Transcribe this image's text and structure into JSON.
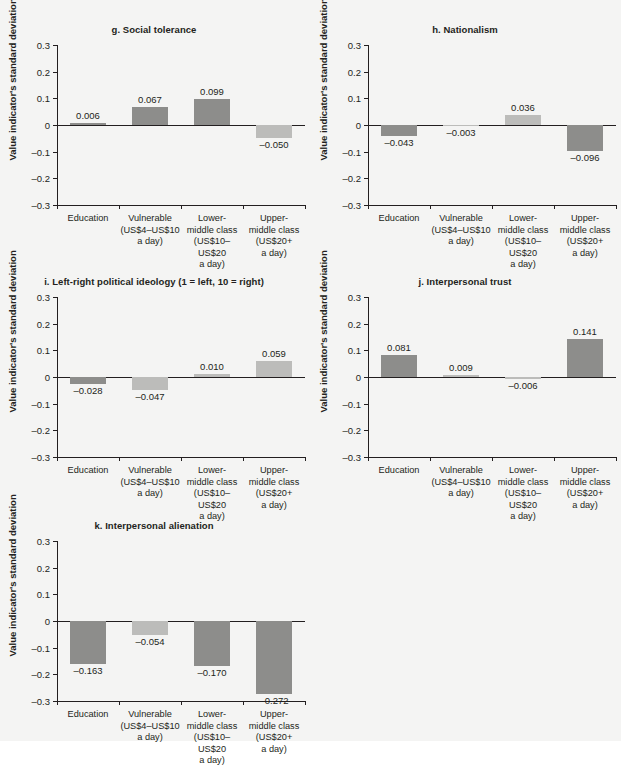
{
  "figure": {
    "background_color": "#f4f4f3",
    "bar_color_dark": "#8d8d8b",
    "bar_color_light": "#bcbcba",
    "axis_color": "#231f20",
    "y_axis_label": "Value indicator's standard deviation",
    "y_ticks": [
      "0.3",
      "0.2",
      "0.1",
      "0",
      "–0.1",
      "–0.2",
      "–0.3"
    ],
    "categories": [
      [
        "Education"
      ],
      [
        "Vulnerable",
        "(US$4–US$10",
        "a day)"
      ],
      [
        "Lower-",
        "middle class",
        "(US$10–US$20",
        "a day)"
      ],
      [
        "Upper-",
        "middle class",
        "(US$20+",
        "a day)"
      ]
    ],
    "caption": ""
  },
  "chart_data": [
    {
      "type": "bar",
      "panel": "g",
      "title": "g.  Social tolerance",
      "categories": [
        "Education",
        "Vulnerable (US$4–US$10 a day)",
        "Lower-middle class (US$10–US$20 a day)",
        "Upper-middle class (US$20+ a day)"
      ],
      "values": [
        0.006,
        0.067,
        0.099,
        -0.05
      ],
      "labels": [
        "0.006",
        "0.067",
        "0.099",
        "–0.050"
      ],
      "shades": [
        "dark",
        "dark",
        "dark",
        "light"
      ],
      "xlabel": "",
      "ylabel": "Value indicator's standard deviation",
      "ylim": [
        -0.3,
        0.3
      ],
      "grid": false,
      "legend": "none"
    },
    {
      "type": "bar",
      "panel": "h",
      "title": "h.  Nationalism",
      "categories": [
        "Education",
        "Vulnerable (US$4–US$10 a day)",
        "Lower-middle class (US$10–US$20 a day)",
        "Upper-middle class (US$20+ a day)"
      ],
      "values": [
        -0.043,
        -0.003,
        0.036,
        -0.096
      ],
      "labels": [
        "–0.043",
        "–0.003",
        "0.036",
        "–0.096"
      ],
      "shades": [
        "dark",
        "light",
        "light",
        "dark"
      ],
      "xlabel": "",
      "ylabel": "Value indicator's standard deviation",
      "ylim": [
        -0.3,
        0.3
      ],
      "grid": false,
      "legend": "none"
    },
    {
      "type": "bar",
      "panel": "i",
      "title": "i.  Left-right political ideology (1 = left, 10 = right)",
      "categories": [
        "Education",
        "Vulnerable (US$4–US$10 a day)",
        "Lower-middle class (US$10–US$20 a day)",
        "Upper-middle class (US$20+ a day)"
      ],
      "values": [
        -0.028,
        -0.047,
        0.01,
        0.059
      ],
      "labels": [
        "–0.028",
        "–0.047",
        "0.010",
        "0.059"
      ],
      "shades": [
        "dark",
        "light",
        "light",
        "light"
      ],
      "xlabel": "",
      "ylabel": "Value indicator's standard deviation",
      "ylim": [
        -0.3,
        0.3
      ],
      "grid": false,
      "legend": "none"
    },
    {
      "type": "bar",
      "panel": "j",
      "title": "j.  Interpersonal trust",
      "categories": [
        "Education",
        "Vulnerable (US$4–US$10 a day)",
        "Lower-middle class (US$10–US$20 a day)",
        "Upper-middle class (US$20+ a day)"
      ],
      "values": [
        0.081,
        0.009,
        -0.006,
        0.141
      ],
      "labels": [
        "0.081",
        "0.009",
        "–0.006",
        "0.141"
      ],
      "shades": [
        "dark",
        "light",
        "light",
        "dark"
      ],
      "xlabel": "",
      "ylabel": "Value indicator's standard deviation",
      "ylim": [
        -0.3,
        0.3
      ],
      "grid": false,
      "legend": "none"
    },
    {
      "type": "bar",
      "panel": "k",
      "title": "k.  Interpersonal alienation",
      "categories": [
        "Education",
        "Vulnerable (US$4–US$10 a day)",
        "Lower-middle class (US$10–US$20 a day)",
        "Upper-middle class (US$20+ a day)"
      ],
      "values": [
        -0.163,
        -0.054,
        -0.17,
        -0.272
      ],
      "labels": [
        "–0.163",
        "–0.054",
        "–0.170",
        "–0.272"
      ],
      "shades": [
        "dark",
        "light",
        "dark",
        "dark"
      ],
      "xlabel": "",
      "ylabel": "Value indicator's standard deviation",
      "ylim": [
        -0.3,
        0.3
      ],
      "grid": false,
      "legend": "none"
    }
  ]
}
